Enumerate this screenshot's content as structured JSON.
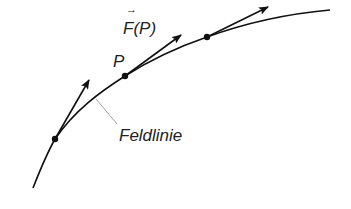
{
  "diagram": {
    "type": "field-line",
    "labels": {
      "point": "P",
      "force": "F(P)",
      "force_vector_arrow": "→",
      "field_line": "Feldlinie"
    },
    "points": [
      {
        "id": "p1",
        "x": 55,
        "y": 139
      },
      {
        "id": "P",
        "x": 125,
        "y": 76
      },
      {
        "id": "p3",
        "x": 207,
        "y": 37
      }
    ],
    "force_vectors": [
      {
        "from": [
          55,
          139
        ],
        "to": [
          89,
          80
        ]
      },
      {
        "from": [
          125,
          76
        ],
        "to": [
          181,
          35
        ]
      },
      {
        "from": [
          207,
          37
        ],
        "to": [
          268,
          7
        ]
      }
    ],
    "colors": {
      "line": "#111111",
      "leader": "#888888",
      "text": "#222222"
    }
  }
}
